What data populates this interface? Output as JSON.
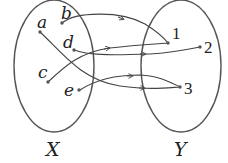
{
  "diagram": {
    "type": "mapping",
    "sets": [
      {
        "name": "X",
        "elements": [
          "a",
          "b",
          "c",
          "d",
          "e"
        ]
      },
      {
        "name": "Y",
        "elements": [
          "1",
          "2",
          "3"
        ]
      }
    ],
    "mappings": [
      {
        "from": "b",
        "to": "1"
      },
      {
        "from": "c",
        "to": "1"
      },
      {
        "from": "d",
        "to": "2"
      },
      {
        "from": "a",
        "to": "3"
      },
      {
        "from": "e",
        "to": "3"
      }
    ],
    "labels": {
      "a": "a",
      "b": "b",
      "c": "c",
      "d": "d",
      "e": "e",
      "one": "1",
      "two": "2",
      "three": "3",
      "setX": "X",
      "setY": "Y"
    },
    "colors": {
      "stroke": "#444444",
      "text": "#222222"
    }
  }
}
